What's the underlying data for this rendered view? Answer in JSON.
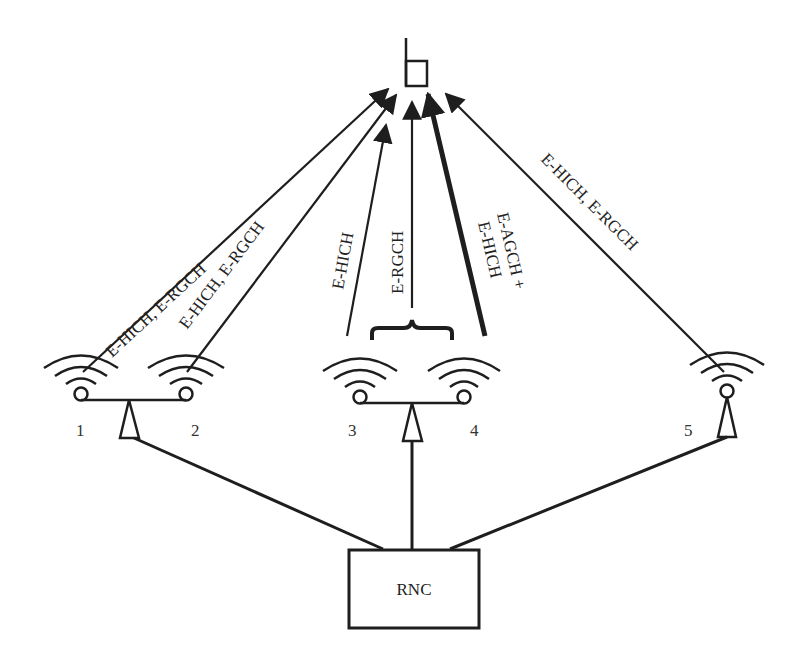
{
  "diagram": {
    "ue": {
      "name": "mobile terminal"
    },
    "base_stations": [
      {
        "id": "1",
        "label": "1"
      },
      {
        "id": "2",
        "label": "2"
      },
      {
        "id": "3",
        "label": "3"
      },
      {
        "id": "4",
        "label": "4"
      },
      {
        "id": "5",
        "label": "5"
      }
    ],
    "links": [
      {
        "from": "1",
        "label": "E-HICH, E-RGCH"
      },
      {
        "from": "2",
        "label": "E-HICH, E-RGCH"
      },
      {
        "from": "3",
        "label": "E-HICH"
      },
      {
        "from": "3+4",
        "label": "E-RGCH"
      },
      {
        "from": "4",
        "label_line1": "E-AGCH +",
        "label_line2": "E-HICH",
        "emphasis": "bold"
      },
      {
        "from": "5",
        "label": "E-HICH, E-RGCH"
      }
    ],
    "controller": {
      "label": "RNC"
    }
  }
}
